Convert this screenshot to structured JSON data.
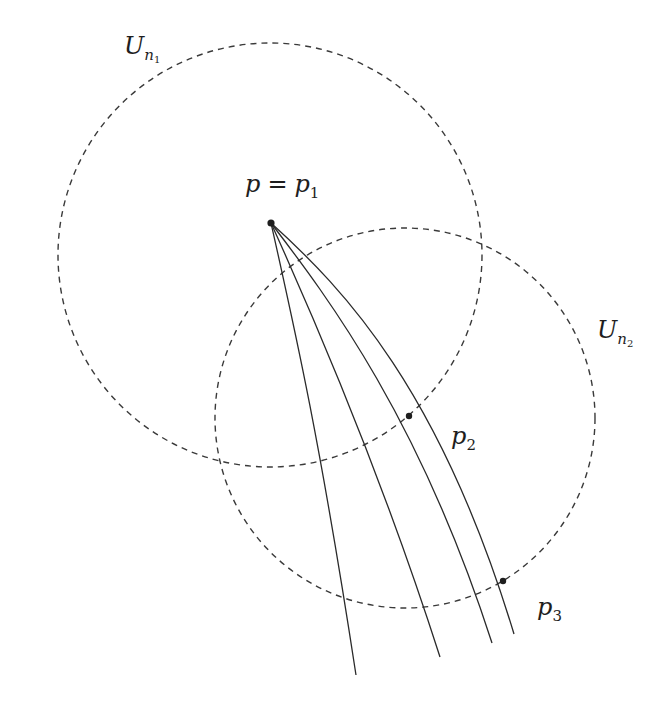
{
  "figure": {
    "background": "#ffffff",
    "stroke_color": "#2a2a2a",
    "dash_color": "#3a3a3a"
  },
  "labels": {
    "u_n1": {
      "base": "U",
      "sub": "n",
      "subsub": "1"
    },
    "u_n2": {
      "base": "U",
      "sub": "n",
      "subsub": "2"
    },
    "p_eq_p1": {
      "lhs": "p",
      "eq": "=",
      "rhs": "p",
      "rhs_sub": "1"
    },
    "p2": {
      "base": "p",
      "sub": "2"
    },
    "p3": {
      "base": "p",
      "sub": "3"
    }
  },
  "geometry": {
    "circle_u_n1": {
      "cx": 270,
      "cy": 255,
      "r": 212
    },
    "circle_u_n2": {
      "cx": 405,
      "cy": 418,
      "r": 190
    },
    "point_p1": {
      "x": 271,
      "y": 223
    },
    "point_p2": {
      "x": 409,
      "y": 416
    },
    "point_p3": {
      "x": 503,
      "y": 581
    },
    "curves": [
      {
        "name": "curve-1",
        "d": "M271,223 C295,330 320,440 356,675"
      },
      {
        "name": "curve-2",
        "d": "M271,223 C315,320 380,470 440,657"
      },
      {
        "name": "curve-3",
        "d": "M271,223 C330,300 420,420 492,643"
      },
      {
        "name": "curve-4",
        "d": "M271,223 C345,290 440,390 514,634"
      }
    ]
  }
}
